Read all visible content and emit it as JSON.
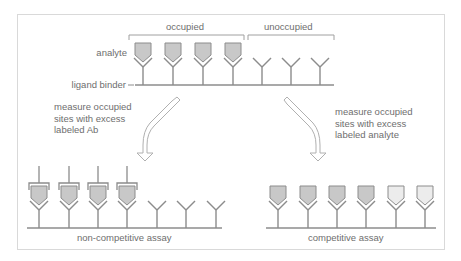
{
  "labels": {
    "occupied": "occupied",
    "unoccupied": "unoccupied",
    "analyte": "analyte",
    "ligand_binder": "ligand binder",
    "left_arrow_caption": "measure occupied\nsites with excess\nlabeled Ab",
    "right_arrow_caption": "measure occupied\nsites with excess\nlabeled analyte",
    "non_competitive": "non-competitive assay",
    "competitive": "competitive assay"
  },
  "colors": {
    "line": "#8c8c8c",
    "analyte_fill": "#c8c8c8",
    "labeled_fill": "#c8c8c8",
    "unlabeled_fill": "#ececec",
    "frame": "#d9d9d9",
    "text": "#6e6e6e"
  },
  "diagram": {
    "top_row": {
      "occupied_count": 4,
      "unoccupied_count": 3
    },
    "non_competitive_row": {
      "labeled_ab_count": 4,
      "empty_count": 3
    },
    "competitive_row": {
      "labeled_analyte_count": 4,
      "unlabeled_analyte_count": 2
    }
  }
}
